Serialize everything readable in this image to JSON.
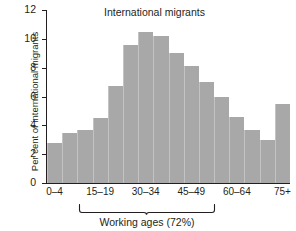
{
  "chart_data": {
    "type": "bar",
    "title": "International migrants",
    "xlabel": "",
    "ylabel": "Per cent of international migrants",
    "ylim": [
      0,
      12
    ],
    "ytick_values": [
      0,
      2,
      4,
      6,
      8,
      10,
      12
    ],
    "ytick_labels": [
      "0",
      "2",
      "4",
      "6",
      "8",
      "10",
      "12"
    ],
    "grid": false,
    "legend": null,
    "categories": [
      "0–4",
      "5–9",
      "10–14",
      "15–19",
      "20–24",
      "25–29",
      "30–34",
      "35–39",
      "40–44",
      "45–49",
      "50–54",
      "55–59",
      "60–64",
      "65–69",
      "70–74",
      "75+"
    ],
    "xtick_labels": [
      "0–4",
      "15–19",
      "30–34",
      "45–49",
      "60–64",
      "75+"
    ],
    "xtick_categories": [
      "0–4",
      "15–19",
      "30–34",
      "45–49",
      "60–64",
      "75+"
    ],
    "values": [
      2.8,
      3.5,
      3.7,
      4.5,
      6.7,
      9.6,
      10.5,
      10.2,
      9.0,
      8.1,
      7.0,
      6.0,
      4.6,
      3.7,
      3.0,
      5.5
    ],
    "bar_color": "#a8a8a8",
    "annotations": [
      {
        "type": "bracket",
        "label": "Working ages (72%)",
        "spans_from": "15–19",
        "spans_to": "60–64"
      }
    ]
  },
  "axis": {
    "ylabel": "Per cent of international migrants"
  },
  "title": "International migrants",
  "annotation": {
    "working_ages_label": "Working ages (72%)"
  }
}
